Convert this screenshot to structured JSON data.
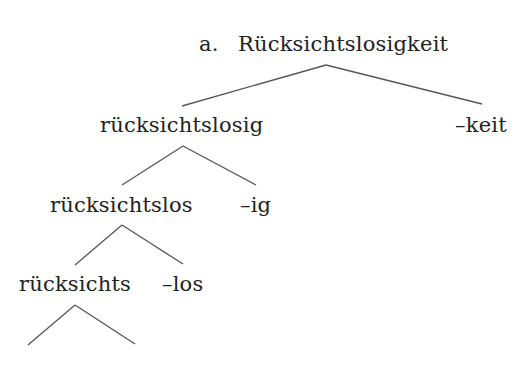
{
  "tree": {
    "example_label": "a.",
    "root": "Rücksichtslosigkeit",
    "nodes": {
      "level1_left": "rücksichtslosig",
      "level1_right": "–keit",
      "level2_left": "rücksichtslos",
      "level2_right": "–ig",
      "level3_left": "rücksichts",
      "level3_right": "–los"
    }
  },
  "colors": {
    "text": "#222222",
    "lines": "#555555",
    "background": "#ffffff"
  }
}
